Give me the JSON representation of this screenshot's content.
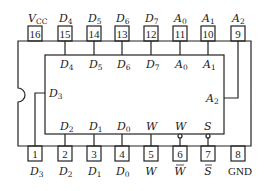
{
  "diagram": {
    "type": "ic-pinout",
    "package": "DIP-16",
    "line_color": "#222222",
    "background": "#ffffff",
    "top_pins": [
      {
        "number": "16",
        "label": "V",
        "sub": "CC",
        "inner_label": "",
        "inner_sub": ""
      },
      {
        "number": "15",
        "label": "D",
        "sub": "4",
        "inner_label": "D",
        "inner_sub": "4"
      },
      {
        "number": "14",
        "label": "D",
        "sub": "5",
        "inner_label": "D",
        "inner_sub": "5"
      },
      {
        "number": "13",
        "label": "D",
        "sub": "6",
        "inner_label": "D",
        "inner_sub": "6"
      },
      {
        "number": "12",
        "label": "D",
        "sub": "7",
        "inner_label": "D",
        "inner_sub": "7"
      },
      {
        "number": "11",
        "label": "A",
        "sub": "0",
        "inner_label": "A",
        "inner_sub": "0"
      },
      {
        "number": "10",
        "label": "A",
        "sub": "1",
        "inner_label": "A",
        "inner_sub": "1"
      },
      {
        "number": "9",
        "label": "A",
        "sub": "2",
        "inner_label": "",
        "inner_sub": ""
      }
    ],
    "bottom_pins": [
      {
        "number": "1",
        "label": "D",
        "sub": "3",
        "overbar": false,
        "inner_label": "",
        "inner_sub": ""
      },
      {
        "number": "2",
        "label": "D",
        "sub": "2",
        "overbar": false,
        "inner_label": "D",
        "inner_sub": "2"
      },
      {
        "number": "3",
        "label": "D",
        "sub": "1",
        "overbar": false,
        "inner_label": "D",
        "inner_sub": "1"
      },
      {
        "number": "4",
        "label": "D",
        "sub": "0",
        "overbar": false,
        "inner_label": "D",
        "inner_sub": "0"
      },
      {
        "number": "5",
        "label": "W",
        "sub": "",
        "overbar": false,
        "inner_label": "W",
        "inner_sub": ""
      },
      {
        "number": "6",
        "label": "W",
        "sub": "",
        "overbar": true,
        "inner_label": "W",
        "inner_sub": "",
        "inverted": true
      },
      {
        "number": "7",
        "label": "S",
        "sub": "",
        "overbar": true,
        "inner_label": "S",
        "inner_sub": "",
        "inverted": true
      },
      {
        "number": "8",
        "label": "GND",
        "sub": "",
        "overbar": false,
        "inner_label": "",
        "inner_sub": ""
      }
    ],
    "side_labels": {
      "left": {
        "label": "D",
        "sub": "3"
      },
      "right": {
        "label": "A",
        "sub": "2"
      }
    }
  }
}
